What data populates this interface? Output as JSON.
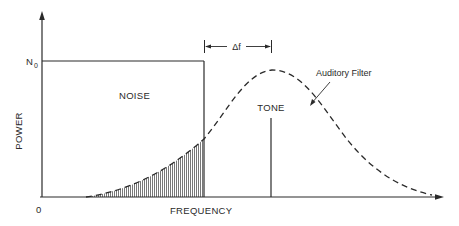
{
  "diagram": {
    "axes": {
      "y_label": "POWER",
      "x_label": "FREQUENCY",
      "origin_label": "0",
      "y_level_label": "N",
      "y_level_subscript": "0"
    },
    "labels": {
      "noise": "NOISE",
      "tone": "TONE",
      "filter": "Auditory Filter",
      "delta_f": "Δf"
    },
    "colors": {
      "ink": "#2a2a2a",
      "background": "#ffffff",
      "hatch": "#555555"
    }
  }
}
